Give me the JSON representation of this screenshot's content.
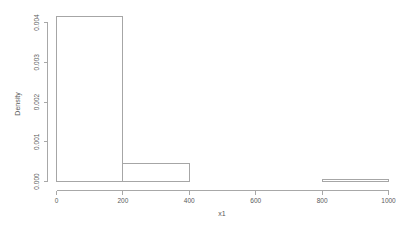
{
  "chart_data": {
    "type": "bar",
    "title": "",
    "subtitle": "",
    "xlabel": "x1",
    "ylabel": "Density",
    "xlim": [
      0,
      1000
    ],
    "ylim": [
      0,
      0.0042
    ],
    "grid": false,
    "legend": false,
    "legend_position": "none",
    "bin_width": 200,
    "bin_edges": [
      0,
      200,
      400,
      600,
      800,
      1000
    ],
    "categories": [
      "0-200",
      "200-400",
      "400-600",
      "600-800",
      "800-1000"
    ],
    "values": [
      0.00415,
      0.00045,
      0.0,
      0.0,
      5e-05
    ],
    "bars": [
      {
        "label": "0-200",
        "x0": 0,
        "x1": 200,
        "density": 0.00415
      },
      {
        "label": "200-400",
        "x0": 200,
        "x1": 400,
        "density": 0.00045
      },
      {
        "label": "400-600",
        "x0": 400,
        "x1": 600,
        "density": 0.0
      },
      {
        "label": "600-800",
        "x0": 600,
        "x1": 800,
        "density": 0.0
      },
      {
        "label": "800-1000",
        "x0": 800,
        "x1": 1000,
        "density": 5e-05
      }
    ],
    "x_ticks": [
      0,
      200,
      400,
      600,
      800,
      1000
    ],
    "x_tick_labels": [
      "0",
      "200",
      "400",
      "600",
      "800",
      "1000"
    ],
    "y_ticks": [
      0.0,
      0.001,
      0.002,
      0.003,
      0.004
    ],
    "y_tick_labels": [
      "0.000",
      "0.001",
      "0.002",
      "0.003",
      "0.004"
    ],
    "colors": {
      "background": "#ffffff",
      "bar_stroke": "#a6a6a6",
      "bar_fill": "none",
      "axis": "#a8a8a8",
      "text": "#5a5a5a"
    }
  },
  "axes": {
    "x_title": "x1",
    "y_title": "Density"
  }
}
